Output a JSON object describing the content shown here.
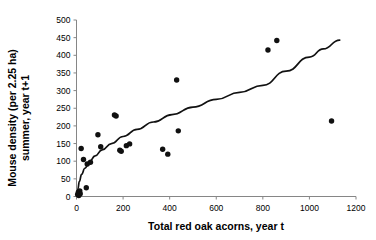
{
  "chart_data": {
    "type": "scatter",
    "title": "",
    "xlabel": "Total red oak acorns, year t",
    "ylabel_line1": "Mouse density (per 2.25 ha)",
    "ylabel_line2": "summer, year t+1",
    "xlim": [
      0,
      1200
    ],
    "ylim": [
      0,
      500
    ],
    "xticks": [
      0,
      200,
      400,
      600,
      800,
      1000,
      1200
    ],
    "yticks": [
      0,
      50,
      100,
      150,
      200,
      250,
      300,
      350,
      400,
      450,
      500
    ],
    "xtick_labels": [
      "0",
      "200",
      "400",
      "600",
      "800",
      "1000",
      "1200"
    ],
    "ytick_labels": [
      "0",
      "50",
      "100",
      "150",
      "200",
      "250",
      "300",
      "350",
      "400",
      "450",
      "500"
    ],
    "grid": false,
    "legend": false,
    "point_color": "#101010",
    "curve_color": "#111111",
    "axis_color": "#868686",
    "series": [
      {
        "name": "Mouse density vs acorn crop",
        "marker": "filled-circle",
        "points": [
          {
            "x": 5,
            "y": 6
          },
          {
            "x": 8,
            "y": 12
          },
          {
            "x": 10,
            "y": 3
          },
          {
            "x": 14,
            "y": 16
          },
          {
            "x": 16,
            "y": 8
          },
          {
            "x": 20,
            "y": 136
          },
          {
            "x": 30,
            "y": 105
          },
          {
            "x": 42,
            "y": 25
          },
          {
            "x": 46,
            "y": 92
          },
          {
            "x": 60,
            "y": 97
          },
          {
            "x": 92,
            "y": 175
          },
          {
            "x": 104,
            "y": 141
          },
          {
            "x": 163,
            "y": 231
          },
          {
            "x": 170,
            "y": 228
          },
          {
            "x": 186,
            "y": 131
          },
          {
            "x": 192,
            "y": 128
          },
          {
            "x": 214,
            "y": 144
          },
          {
            "x": 228,
            "y": 149
          },
          {
            "x": 370,
            "y": 134
          },
          {
            "x": 392,
            "y": 120
          },
          {
            "x": 430,
            "y": 330
          },
          {
            "x": 437,
            "y": 186
          },
          {
            "x": 822,
            "y": 415
          },
          {
            "x": 860,
            "y": 442
          },
          {
            "x": 1095,
            "y": 214
          }
        ]
      }
    ],
    "fit_curve": {
      "name": "logarithmic fit",
      "points": [
        {
          "x": 2,
          "y": 2
        },
        {
          "x": 6,
          "y": 22
        },
        {
          "x": 12,
          "y": 42
        },
        {
          "x": 22,
          "y": 63
        },
        {
          "x": 36,
          "y": 80
        },
        {
          "x": 55,
          "y": 98
        },
        {
          "x": 80,
          "y": 115
        },
        {
          "x": 110,
          "y": 132
        },
        {
          "x": 150,
          "y": 150
        },
        {
          "x": 200,
          "y": 170
        },
        {
          "x": 260,
          "y": 190
        },
        {
          "x": 330,
          "y": 211
        },
        {
          "x": 410,
          "y": 232
        },
        {
          "x": 500,
          "y": 253
        },
        {
          "x": 600,
          "y": 275
        },
        {
          "x": 700,
          "y": 295
        },
        {
          "x": 800,
          "y": 315
        },
        {
          "x": 900,
          "y": 355
        },
        {
          "x": 1000,
          "y": 395
        },
        {
          "x": 1060,
          "y": 418
        },
        {
          "x": 1130,
          "y": 443
        }
      ]
    }
  }
}
